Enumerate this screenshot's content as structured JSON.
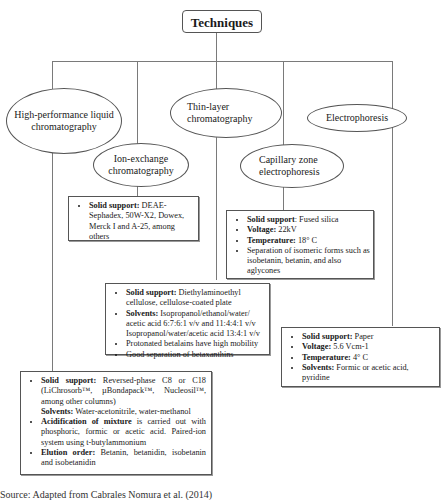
{
  "root": {
    "label": "Techniques"
  },
  "nodes": {
    "hplc": {
      "label": "High-performance liquid chromatography"
    },
    "ion_exchange": {
      "label": "Ion-exchange chromatography"
    },
    "tlc": {
      "label": "Thin-layer chromatography"
    },
    "capillary": {
      "label": "Capillary zone electrophoresis"
    },
    "electrophoresis": {
      "label": "Electrophoresis"
    }
  },
  "details": {
    "ion_exchange": {
      "items": [
        {
          "bold": "Solid support:",
          "text": " DEAE-Sephadex, 50W-X2, Dowex, Merck I and A-25, among others"
        }
      ]
    },
    "capillary": {
      "items": [
        {
          "bold": "Solid support",
          "text": ": Fused silica"
        },
        {
          "bold": "Voltage:",
          "text": " 22kV"
        },
        {
          "bold": "Temperature:",
          "text": " 18° C"
        },
        {
          "bold": "",
          "text": "Separation of isomeric forms such as isobetanin, betanin, and also aglycones"
        }
      ]
    },
    "tlc": {
      "items": [
        {
          "bold": "Solid support:",
          "text": " Diethylaminoethyl cellulose, cellulose-coated plate"
        },
        {
          "bold": "Solvents:",
          "text": " Isopropanol/ethanol/water/ acetic acid 6:7:6:1 v/v and 11:4:4:1 v/v Isopropanol/water/acetic acid 13:4:1 v/v"
        },
        {
          "bold": "",
          "text": "Protonated betalains have high mobility"
        },
        {
          "bold": "",
          "text": "Good separation of betaxanthins"
        }
      ]
    },
    "electrophoresis": {
      "items": [
        {
          "bold": "Solid support:",
          "text": " Paper"
        },
        {
          "bold": "Voltage:",
          "text": " 5.6 Vcm-1"
        },
        {
          "bold": "Temperature:",
          "text": " 4° C"
        },
        {
          "bold": "Solvents:",
          "text": " Formic or acetic acid, pyridine"
        }
      ]
    },
    "hplc": {
      "items": [
        {
          "bold": "Solid support:",
          "text": " Reversed-phase C8 or C18 (LiChrosorb™, µBondapack™, Nucleosil™, among other columns)"
        },
        {
          "bold": "Solvents:",
          "text": " Water-acetonitrile, water-methanol"
        },
        {
          "bold": "Acidification of mixture",
          "text": " is carried out with phosphoric, formic or acetic acid. Paired-ion system using t-butylammonium"
        },
        {
          "bold": "Elution order:",
          "text": " Betanin, betanidin, isobetanin and isobetanidin"
        }
      ]
    }
  },
  "caption": {
    "text": "Source: Adapted from Cabrales Nomura et al. (2014)"
  }
}
